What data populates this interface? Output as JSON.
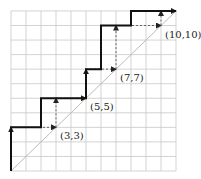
{
  "diagram": {
    "grid": {
      "cols": 11,
      "rows": 11
    },
    "labels": [
      {
        "text": "(3,3)",
        "x": 3,
        "y": 3
      },
      {
        "text": "(5,5)",
        "x": 5,
        "y": 5
      },
      {
        "text": "(7,7)",
        "x": 7,
        "y": 7
      },
      {
        "text": "(10,10)",
        "x": 10,
        "y": 10
      }
    ],
    "staircase_path": [
      [
        0,
        0
      ],
      [
        0,
        3
      ],
      [
        2,
        3
      ],
      [
        2,
        5
      ],
      [
        5,
        5
      ],
      [
        5,
        7
      ],
      [
        6,
        7
      ],
      [
        6,
        10
      ],
      [
        8,
        10
      ],
      [
        8,
        11
      ],
      [
        11,
        11
      ]
    ],
    "dashed_steps": [
      [
        0,
        0
      ],
      [
        0,
        3
      ],
      [
        3,
        3
      ],
      [
        3,
        5
      ],
      [
        5,
        5
      ],
      [
        5,
        7
      ],
      [
        7,
        7
      ],
      [
        7,
        10
      ],
      [
        10,
        10
      ],
      [
        10,
        11
      ],
      [
        11,
        11
      ]
    ],
    "colors": {
      "grid": "#c8c8c8",
      "path": "#111111",
      "diagonal": "#bbbbbb",
      "dashed": "#666666"
    }
  }
}
